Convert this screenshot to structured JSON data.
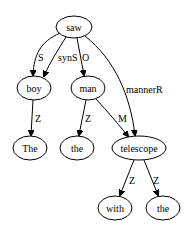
{
  "diagram": {
    "type": "dependency-tree",
    "nodes": [
      {
        "id": "saw",
        "label": "saw"
      },
      {
        "id": "boy",
        "label": "boy"
      },
      {
        "id": "man",
        "label": "man"
      },
      {
        "id": "The",
        "label": "The"
      },
      {
        "id": "the1",
        "label": "the"
      },
      {
        "id": "telescope",
        "label": "telescope"
      },
      {
        "id": "with",
        "label": "with"
      },
      {
        "id": "the2",
        "label": "the"
      }
    ],
    "edges": [
      {
        "from": "saw",
        "to": "boy",
        "label": "S"
      },
      {
        "from": "saw",
        "to": "boy",
        "label": "synS"
      },
      {
        "from": "saw",
        "to": "man",
        "label": "O"
      },
      {
        "from": "saw",
        "to": "telescope",
        "label": "mannerR"
      },
      {
        "from": "boy",
        "to": "The",
        "label": "Z"
      },
      {
        "from": "man",
        "to": "the1",
        "label": "Z"
      },
      {
        "from": "man",
        "to": "telescope",
        "label": "M"
      },
      {
        "from": "telescope",
        "to": "with",
        "label": "Z"
      },
      {
        "from": "telescope",
        "to": "the2",
        "label": "Z"
      }
    ]
  }
}
